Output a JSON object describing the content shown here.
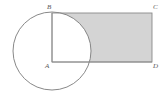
{
  "figure": {
    "background_color": "#ffffff",
    "stroke_color": "#7a7a7a",
    "shade_color": "#d4d4d4",
    "label_color": "#5a5a5a",
    "labels": {
      "A": "A",
      "B": "B",
      "C": "C",
      "D": "D"
    },
    "shapes": {
      "circle": {
        "center_x": 52,
        "center_y": 51,
        "radius": 39
      },
      "rectangle": {
        "x": 52,
        "y": 13,
        "width": 100,
        "height": 49
      },
      "segment_AB": {
        "x1": 52,
        "y1": 13,
        "x2": 52,
        "y2": 62
      },
      "segment_AD": {
        "x1": 52,
        "y1": 62,
        "x2": 152,
        "y2": 62
      }
    },
    "shaded_region": "rectangle ABCD minus quarter-disc at corner A"
  }
}
